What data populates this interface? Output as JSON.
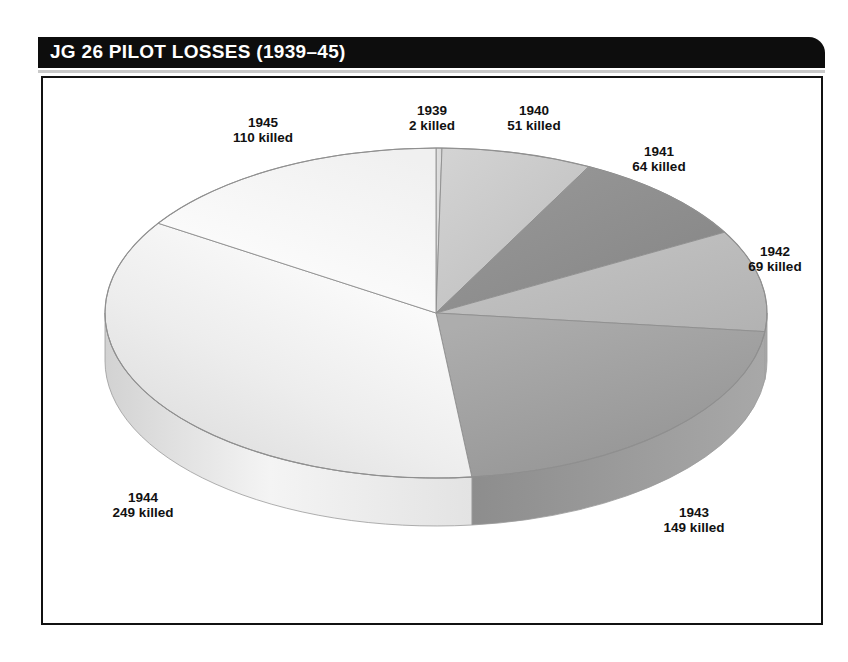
{
  "header": {
    "title": "JG 26 PILOT LOSSES (1939–45)"
  },
  "chart_data": {
    "type": "pie",
    "title": "JG 26 PILOT LOSSES (1939–45)",
    "style": "3d-exploded-none",
    "unit": "killed",
    "total": 694,
    "categories": [
      "1939",
      "1940",
      "1941",
      "1942",
      "1943",
      "1944",
      "1945"
    ],
    "values": [
      2,
      51,
      64,
      69,
      149,
      249,
      110
    ],
    "labels": [
      {
        "year": "1939",
        "killed_text": "2 killed",
        "value": 2
      },
      {
        "year": "1940",
        "killed_text": "51 killed",
        "value": 51
      },
      {
        "year": "1941",
        "killed_text": "64 killed",
        "value": 64
      },
      {
        "year": "1942",
        "killed_text": "69 killed",
        "value": 69
      },
      {
        "year": "1943",
        "killed_text": "149 killed",
        "value": 149
      },
      {
        "year": "1944",
        "killed_text": "249 killed",
        "value": 249
      },
      {
        "year": "1945",
        "killed_text": "110 killed",
        "value": 110
      }
    ],
    "slice_colors": [
      "#d9d9d9",
      "#c9c9c9",
      "#8e8e8e",
      "#bdbdbd",
      "#a0a0a0",
      "#f2f2f2",
      "#fbfbfb"
    ],
    "legend": "none",
    "grid": false,
    "start_angle_deg": 0,
    "direction": "clockwise"
  },
  "colors": {
    "title_bar_bg": "#0d0d0d",
    "title_text": "#ffffff",
    "frame_border": "#111111",
    "page_bg": "#ffffff",
    "label_text": "#111111"
  }
}
